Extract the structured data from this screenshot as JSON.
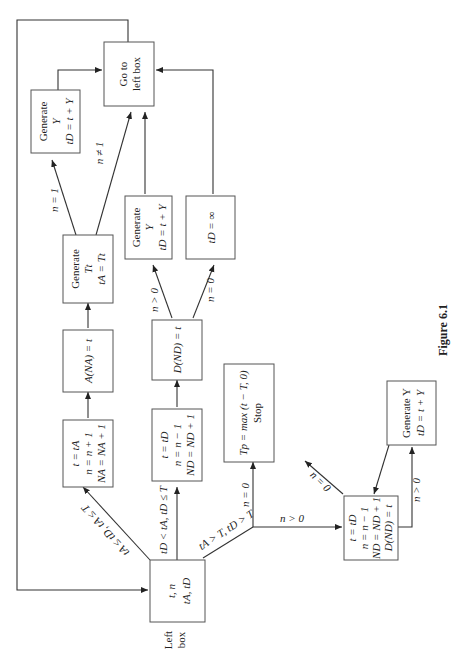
{
  "figure_caption": "Figure 6.1",
  "left_box_label": [
    "Left",
    "box"
  ],
  "nodes": {
    "left_box": [
      "t, n",
      "tA, tD"
    ],
    "arrival_update": [
      "t = tA",
      "n = n + 1",
      "NA = NA + 1"
    ],
    "arrival_record": [
      "A(NA) = t"
    ],
    "generate_arrival": [
      "Generate",
      "Tt",
      "tA = Tt"
    ],
    "generate_service_1": [
      "Generate",
      "Y",
      "tD = t + Y"
    ],
    "goto_left_1": [
      "Go to",
      "left box"
    ],
    "departure_update": [
      "t = tD",
      "n = n − 1",
      "ND = ND + 1"
    ],
    "departure_record": [
      "D(ND) = t"
    ],
    "generate_service_2": [
      "Generate",
      "Y",
      "tD = t + Y"
    ],
    "set_infinity": [
      "tD = ∞"
    ],
    "stop_box": [
      "Tp = max (t − T, 0)",
      "Stop"
    ],
    "final_departure": [
      "t = tD",
      "n = n − 1",
      "ND = ND + 1",
      "D(ND) = t"
    ],
    "generate_service_3": [
      "Generate Y",
      "tD = t + Y"
    ]
  },
  "edge_labels": {
    "arrival_branch": "tA ≤ tD, tA ≤ T",
    "departure_branch": "tD < tA, tD ≤ T",
    "after_close_branch": "tA > T, tD > T",
    "n_eq_1": "n = 1",
    "n_ne_1": "n ≠ 1",
    "n_gt_0_a": "n > 0",
    "n_eq_0_a": "n = 0",
    "n_eq_0_b": "n = 0",
    "n_gt_0_b": "n > 0",
    "n_eq_0_c": "n = 0",
    "n_gt_0_c": "n > 0"
  }
}
